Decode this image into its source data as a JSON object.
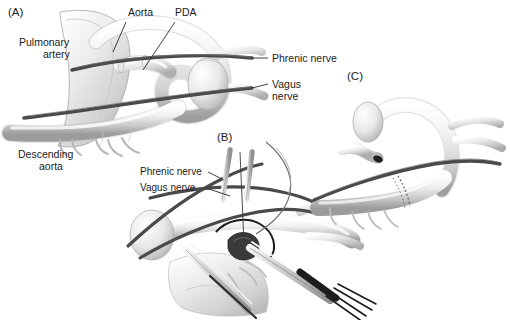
{
  "figure": {
    "background_color": "#ffffff",
    "vessel_fill_light": "#fdfdfd",
    "vessel_fill_mid": "#d4d4d4",
    "vessel_fill_dark": "#9a9a9a",
    "vessel_outline_color": "#8d8d8d",
    "nerve_color": "#4a4a4a",
    "leader_line_color": "#2b2b2b",
    "text_color": "#1b1b1b",
    "instrument_dark": "#1c1c1c"
  },
  "panels": [
    {
      "id": "A",
      "label": "(A)",
      "caption": "Anatomic relationships of the aortic arch, pulmonary artery and ductus arteriosus with phrenic and vagus nerves",
      "annotations": [
        {
          "name": "pulmonary-artery",
          "text": "Pulmonary\nartery",
          "line1": "Pulmonary",
          "line2": "artery"
        },
        {
          "name": "aorta",
          "text": "Aorta"
        },
        {
          "name": "pda",
          "text": "PDA"
        },
        {
          "name": "phrenic-nerve",
          "text": "Phrenic nerve"
        },
        {
          "name": "vagus-nerve",
          "text": "Vagus\nnerve",
          "line1": "Vagus",
          "line2": "nerve"
        },
        {
          "name": "descending-aorta",
          "text": "Descending\naorta",
          "line1": "Descending",
          "line2": "aorta"
        }
      ]
    },
    {
      "id": "B",
      "label": "(B)",
      "caption": "Operative exposure of the ductus with retraction of phrenic and vagus nerves and clip applier in place",
      "annotations": [
        {
          "name": "phrenic-nerve",
          "text": "Phrenic nerve"
        },
        {
          "name": "vagus-nerve",
          "text": "Vagus nerve"
        }
      ]
    },
    {
      "id": "C",
      "label": "(C)",
      "caption": "Completed division of the ductus with oversewn aortic and pulmonary ends",
      "annotations": []
    }
  ]
}
